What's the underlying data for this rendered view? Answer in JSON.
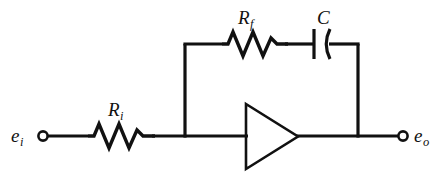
{
  "figure": {
    "type": "circuit-diagram",
    "width": 444,
    "height": 180,
    "ink_color": "#111111",
    "background_color": "#ffffff"
  },
  "labels": {
    "input_signal": {
      "base": "e",
      "sub": "i",
      "text": "e_i"
    },
    "output_signal": {
      "base": "e",
      "sub": "o",
      "text": "e_o"
    },
    "input_resistor": {
      "base": "R",
      "sub": "i",
      "text": "R_i"
    },
    "feedback_resistor": {
      "base": "R",
      "sub": "f",
      "text": "R_f"
    },
    "capacitor": {
      "base": "C",
      "sub": "",
      "text": "C"
    }
  },
  "components": [
    {
      "name": "input-resistor",
      "symbol": "resistor",
      "label": "R_i",
      "branch": "input"
    },
    {
      "name": "feedback-resistor",
      "symbol": "resistor",
      "label": "R_f",
      "branch": "feedback"
    },
    {
      "name": "feedback-capacitor",
      "symbol": "capacitor",
      "label": "C",
      "branch": "feedback"
    },
    {
      "name": "amplifier",
      "symbol": "triangle-amplifier",
      "label": "",
      "branch": "main"
    },
    {
      "name": "input-terminal",
      "symbol": "open-circle-terminal",
      "label": "e_i",
      "branch": "input"
    },
    {
      "name": "output-terminal",
      "symbol": "open-circle-terminal",
      "label": "e_o",
      "branch": "output"
    }
  ]
}
